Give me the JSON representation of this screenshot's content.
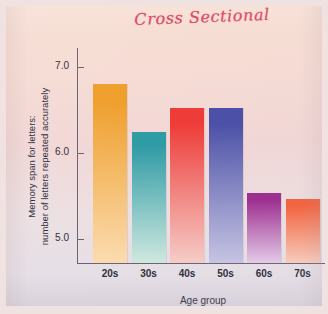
{
  "figure": {
    "handwritten_annotation": "Cross Sectional",
    "annotation_color": "#d6405c",
    "background_color": "#f5dbd4"
  },
  "axes": {
    "ylabel_line1": "Memory span for letters:",
    "ylabel_line2": "number of letters repeated accurately",
    "xlabel": "Age group",
    "yticks": [
      "5.0",
      "6.0",
      "7.0"
    ]
  },
  "chart_data": {
    "type": "bar",
    "title": "Cross Sectional",
    "xlabel": "Age group",
    "ylabel": "Memory span for letters: number of letters repeated accurately",
    "categories": [
      "20s",
      "30s",
      "40s",
      "50s",
      "60s",
      "70s"
    ],
    "values": [
      6.8,
      6.24,
      6.52,
      6.52,
      5.53,
      5.46
    ],
    "ylim": [
      4.72,
      7.22
    ],
    "ytick_values": [
      5.0,
      6.0,
      7.0
    ],
    "grid": false,
    "legend": false,
    "bar_colors_top": [
      "#ef9f2c",
      "#2e9ba5",
      "#ee3b37",
      "#4a4fa6",
      "#9c2b8f",
      "#f4603a"
    ],
    "bar_colors_bottom": [
      "#fbdcb0",
      "#cfe9e0",
      "#f6cdc8",
      "#c6c4e4",
      "#e4cbe8",
      "#f9cdbc"
    ]
  }
}
